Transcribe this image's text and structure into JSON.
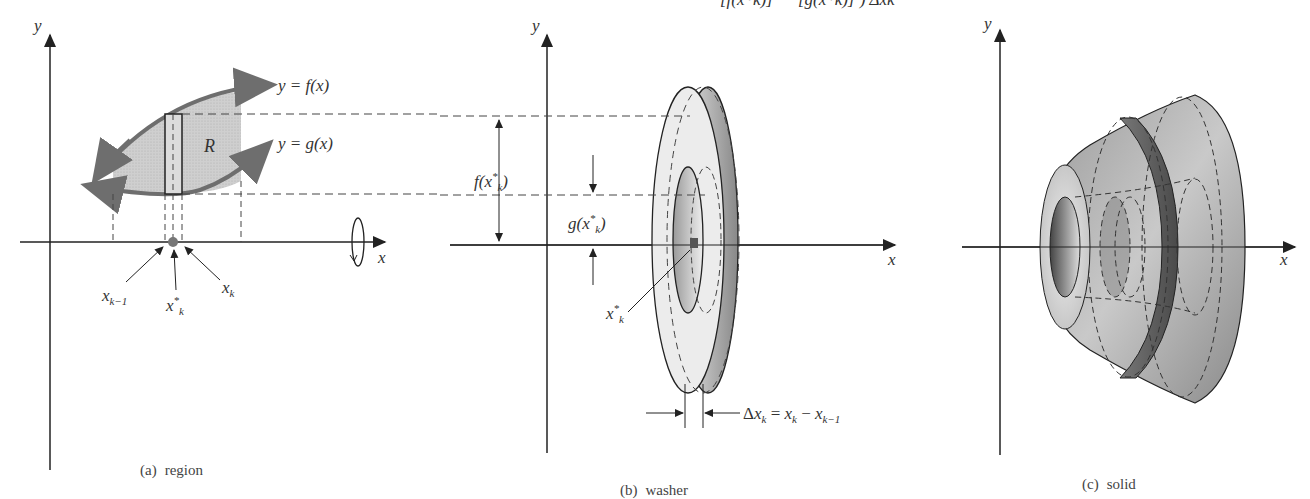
{
  "figure": {
    "top_formula_fragment": "[f(x*k)]² − [g(x*k)]²) Δxk",
    "panels": [
      {
        "id": "a",
        "caption_tag": "(a)",
        "caption_text": "region",
        "axis_x": "x",
        "axis_y": "y",
        "curve_upper_label": "y = f(x)",
        "curve_lower_label": "y = g(x)",
        "region_label": "R",
        "tick_labels": [
          "x_{k-1}",
          "x*_k",
          "x_k"
        ],
        "rotation_icon": "rotation-about-x-axis"
      },
      {
        "id": "b",
        "caption_tag": "(b)",
        "caption_text": "washer",
        "axis_x": "x",
        "axis_y": "y",
        "outer_radius_label": "f(x*k)",
        "inner_radius_label": "g(x*k)",
        "center_label": "x*k",
        "thickness_label": "Δxk = xk − xk−1"
      },
      {
        "id": "c",
        "caption_tag": "(c)",
        "caption_text": "solid",
        "axis_x": "x",
        "axis_y": "y"
      }
    ],
    "colors": {
      "curve": "#6e6e6e",
      "region_fill": "#c9c9c9",
      "washer_light": "#ececec",
      "washer_dark": "#8a8a8a",
      "solid_mid": "#a8a8a8",
      "solid_dark": "#5e5e5e",
      "line": "#222222"
    }
  }
}
